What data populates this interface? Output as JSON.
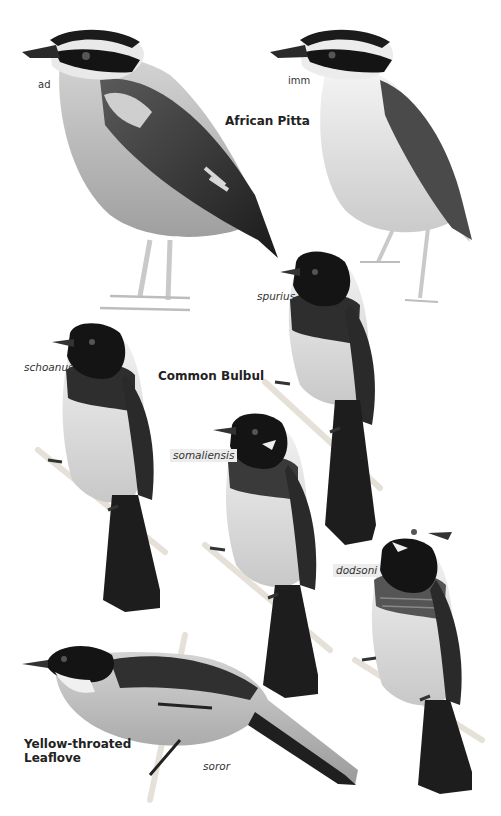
{
  "plate": {
    "background": "#ffffff",
    "palette": {
      "black": "#161616",
      "dark": "#2e2e2e",
      "mid": "#6a6a6a",
      "light": "#b9b9b9",
      "pale": "#dedede",
      "white": "#f7f7f7",
      "branch": "#e6e1d8"
    }
  },
  "species": [
    {
      "name": "African Pitta",
      "figures": [
        {
          "label": "ad"
        },
        {
          "label": "imm"
        }
      ]
    },
    {
      "name": "Common Bulbul",
      "figures": [
        {
          "label": "spurius"
        },
        {
          "label": "schoanus"
        },
        {
          "label": "somaliensis"
        },
        {
          "label": "dodsoni"
        }
      ]
    },
    {
      "name": "Yellow-throated Leaflove",
      "figures": [
        {
          "label": "soror"
        }
      ]
    }
  ]
}
